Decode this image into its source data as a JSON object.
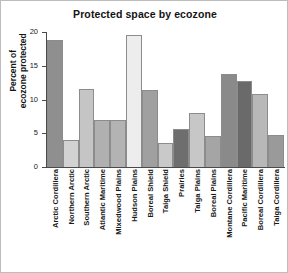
{
  "chart_data": {
    "type": "bar",
    "title": "Protected space by ecozone",
    "xlabel": "",
    "ylabel": "Percent of ecozone protected",
    "ylim": [
      0,
      20
    ],
    "yticks": [
      0,
      5,
      10,
      15,
      20
    ],
    "grid": false,
    "legend": null,
    "categories": [
      "Arctic Cordillera",
      "Northern Arctic",
      "Southern Arctic",
      "Atlantic Maritime",
      "Mixedwood Plains",
      "Hudson Plains",
      "Boreal Shield",
      "Taiga Shield",
      "Prairies",
      "Taiga Plains",
      "Boreal Plains",
      "Montane Cordillera",
      "Pacific Maritime",
      "Boreal Cordillera",
      "Taiga Cordillera"
    ],
    "values": [
      18.8,
      4.0,
      11.6,
      6.9,
      6.9,
      19.5,
      11.4,
      3.5,
      5.6,
      8.0,
      4.6,
      13.8,
      12.7,
      10.8,
      4.7
    ],
    "bar_colors": [
      "#8f8f8f",
      "#d2d2d2",
      "#c5c5c5",
      "#b0b0b0",
      "#b3b3b3",
      "#ededed",
      "#a0a0a0",
      "#c9c9c9",
      "#6e6e6e",
      "#c7c7c7",
      "#a5a5a5",
      "#8a8a8a",
      "#6a6a6a",
      "#b8b8b8",
      "#9a9a9a"
    ]
  },
  "ylabel_lines": {
    "line1": "Percent of",
    "line2": "ecozone protected"
  },
  "colors": {
    "axis": "#4a4a4a",
    "text": "#1a1a1a",
    "frame": "#bdbdbd",
    "bar_outline": "#8c8c8c"
  }
}
